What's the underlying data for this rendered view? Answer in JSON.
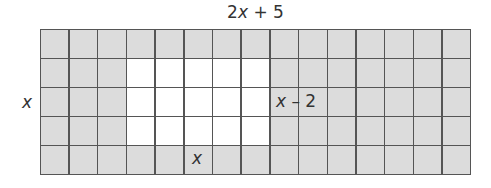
{
  "diagram": {
    "type": "area-model-grid",
    "grid": {
      "columns": 15,
      "rows": 5,
      "shaded_color": "#dcdcdc",
      "unshaded_color": "#ffffff",
      "line_color": "#555555",
      "unshaded_region": {
        "row_start": 1,
        "row_end": 3,
        "col_start": 3,
        "col_end": 7
      }
    },
    "labels": {
      "top": {
        "coef": "2",
        "var": "x",
        "rest": " + 5"
      },
      "left": {
        "var": "x"
      },
      "inner_right": {
        "var": "x",
        "rest": " – 2"
      },
      "inner_bottom": {
        "var": "x"
      }
    }
  }
}
